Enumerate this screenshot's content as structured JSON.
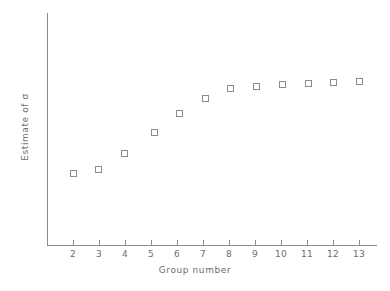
{
  "chart_data": {
    "type": "scatter",
    "title": "",
    "xlabel": "Group number",
    "ylabel": "Estimate of σ",
    "x": [
      2,
      3,
      4,
      5,
      6,
      7,
      8,
      9,
      10,
      11,
      12,
      13
    ],
    "xtick_labels": [
      "2",
      "3",
      "4",
      "5",
      "6",
      "7",
      "8",
      "9",
      "10",
      "11",
      "12",
      "13"
    ],
    "xlim": [
      1.2,
      13.8
    ],
    "values": [
      0.4,
      0.425,
      0.525,
      0.65,
      0.77,
      0.862,
      0.925,
      0.943,
      0.955,
      0.958,
      0.968,
      0.974
    ],
    "ytick_labels": [],
    "ylim": [
      0.0,
      1.15
    ],
    "grid": false,
    "legend": null,
    "marker": "open-square",
    "marker_color": "#8c8c8c",
    "axis_color": "#8a8a8a",
    "pixel_points": [
      {
        "x": 73,
        "y": 173
      },
      {
        "x": 98,
        "y": 169
      },
      {
        "x": 124,
        "y": 153
      },
      {
        "x": 154,
        "y": 132
      },
      {
        "x": 179,
        "y": 113
      },
      {
        "x": 205,
        "y": 98
      },
      {
        "x": 230,
        "y": 88
      },
      {
        "x": 256,
        "y": 86
      },
      {
        "x": 282,
        "y": 84
      },
      {
        "x": 308,
        "y": 83
      },
      {
        "x": 333,
        "y": 82
      },
      {
        "x": 359,
        "y": 81
      }
    ],
    "xtick_pixels": [
      73,
      99,
      125,
      151,
      177,
      203,
      229,
      255,
      281,
      307,
      333,
      359
    ]
  }
}
